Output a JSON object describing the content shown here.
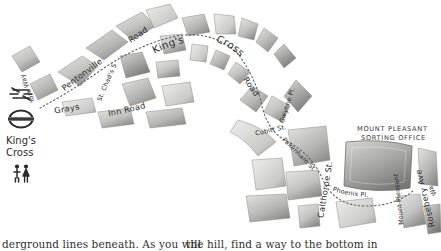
{
  "figure": {
    "kind": "hand-drawn-pencil-map",
    "background_color": "#ffffff",
    "ink_color": "#2b2b2b",
    "block_fill_light": "#d9d9d7",
    "block_fill_mid": "#b9b9b7",
    "block_fill_dark": "#9a9a98",
    "route_color": "#6e6e6c"
  },
  "streets": [
    {
      "id": "york-way",
      "label": "York Way"
    },
    {
      "id": "pentonville-road",
      "label": "Pentonville"
    },
    {
      "id": "pentonville-road2",
      "label": "Road"
    },
    {
      "id": "grays",
      "label": "Grays"
    },
    {
      "id": "inn-road",
      "label": "Inn Road"
    },
    {
      "id": "st-chads-st",
      "label": "St. Chad's St."
    },
    {
      "id": "kings",
      "label": "King's"
    },
    {
      "id": "cross",
      "label": "Cross"
    },
    {
      "id": "kings-cross-road",
      "label": "Road"
    },
    {
      "id": "gwynne-pl",
      "label": "Gwynne Pl."
    },
    {
      "id": "cubitt-st",
      "label": "Cubitt St."
    },
    {
      "id": "pakenham-st",
      "label": "Pakenham St."
    },
    {
      "id": "calthorpe-st",
      "label": "Calthorpe St."
    },
    {
      "id": "phoenix-pl",
      "label": "Phoenix Pl."
    },
    {
      "id": "mount-pleasant",
      "label": "Mount Pleasant"
    },
    {
      "id": "rosebery-ave",
      "label": "Rosebery Ave"
    },
    {
      "id": "warner-st",
      "label": "Wa"
    }
  ],
  "poi": {
    "sorting_office_line1": "MOUNT PLEASANT",
    "sorting_office_line2": "SORTING OFFICE"
  },
  "station": {
    "name_line1": "King's",
    "name_line2": "Cross",
    "icons": [
      {
        "id": "national-rail-icon",
        "name": "national-rail-icon"
      },
      {
        "id": "underground-roundel-icon",
        "name": "underground-roundel-icon"
      },
      {
        "id": "toilets-icon",
        "name": "toilets-icon"
      }
    ]
  },
  "caption": {
    "column_a": "derground lines beneath. As you will",
    "column_b": "the hill, find a way to the bottom in"
  }
}
